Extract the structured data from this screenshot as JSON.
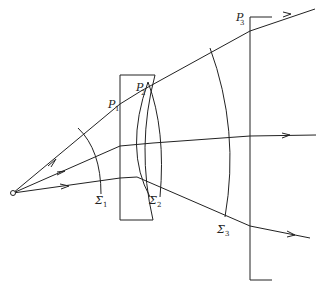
{
  "diagram": {
    "type": "optics-ray-diagram",
    "source": {
      "label": "",
      "x": 13,
      "y": 193
    },
    "labels": {
      "p1": {
        "main": "P",
        "sub": "1"
      },
      "p2": {
        "main": "P",
        "sub": "2"
      },
      "p3": {
        "main": "P",
        "sub": "3"
      },
      "sigma1": {
        "main": "Σ",
        "sub": "1"
      },
      "sigma2": {
        "main": "Σ",
        "sub": "2"
      },
      "sigma3": {
        "main": "Σ",
        "sub": "3"
      }
    },
    "rays": [
      {
        "name": "upper-ray",
        "points": [
          [
            13,
            193
          ],
          [
            120,
            104
          ],
          [
            141,
            91
          ],
          [
            250,
            31
          ],
          [
            310,
            18
          ]
        ]
      },
      {
        "name": "middle-ray",
        "points": [
          [
            13,
            193
          ],
          [
            120,
            146
          ],
          [
            153,
            143
          ],
          [
            250,
            136
          ],
          [
            310,
            136
          ]
        ]
      },
      {
        "name": "lower-ray",
        "points": [
          [
            13,
            193
          ],
          [
            120,
            178
          ],
          [
            137,
            177
          ],
          [
            250,
            226
          ],
          [
            310,
            237
          ]
        ]
      }
    ],
    "wavefronts": [
      "Σ1",
      "Σ2",
      "Σ3"
    ],
    "colors": {
      "ink": "#222222",
      "background": "#ffffff"
    }
  }
}
